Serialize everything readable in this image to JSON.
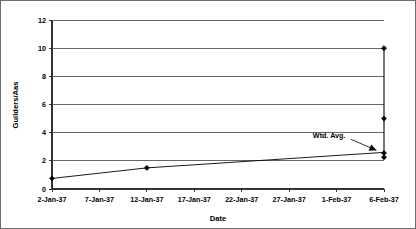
{
  "chart_data": {
    "type": "scatter",
    "title": "",
    "xlabel": "Date",
    "ylabel": "Guilders/Aas",
    "ylim": [
      0,
      12
    ],
    "yticks": [
      0,
      2,
      4,
      6,
      8,
      10,
      12
    ],
    "ytick_labels": [
      "0",
      "2",
      "4",
      "6",
      "8",
      "10",
      "12"
    ],
    "xtick_labels": [
      "2-Jan-37",
      "7-Jan-37",
      "12-Jan-37",
      "17-Jan-37",
      "22-Jan-37",
      "27-Jan-37",
      "1-Feb-37",
      "6-Feb-37"
    ],
    "xtick_positions": [
      0,
      5,
      10,
      15,
      20,
      25,
      30,
      35
    ],
    "xlim": [
      0,
      35
    ],
    "grid": "horizontal",
    "legend": "none",
    "series": [
      {
        "name": "Guilders per Aas",
        "marker": "filled-diamond",
        "points": [
          {
            "x": 0,
            "xlabel": "2-Jan-37",
            "y": 0.75
          },
          {
            "x": 10,
            "xlabel": "12-Jan-37",
            "y": 1.5
          },
          {
            "x": 35,
            "xlabel": "6-Feb-37",
            "y": 10.0
          },
          {
            "x": 35,
            "xlabel": "6-Feb-37",
            "y": 5.0
          },
          {
            "x": 35,
            "xlabel": "6-Feb-37",
            "y": 2.55
          },
          {
            "x": 35,
            "xlabel": "6-Feb-37",
            "y": 2.25
          }
        ]
      },
      {
        "name": "Wtd. Avg.",
        "marker": "none",
        "points": [
          {
            "x": 0,
            "xlabel": "2-Jan-37",
            "y": 0.75
          },
          {
            "x": 10,
            "xlabel": "12-Jan-37",
            "y": 1.5
          },
          {
            "x": 35,
            "xlabel": "6-Feb-37",
            "y": 2.6
          }
        ]
      }
    ],
    "annotations": [
      {
        "text": "Wtd. Avg.",
        "label_x": 27.5,
        "label_y": 3.6,
        "target_x": 34.2,
        "target_y": 2.75
      }
    ],
    "vertical_connector": {
      "x": 35,
      "y_top": 10.0,
      "y_bottom": 2.25
    }
  }
}
